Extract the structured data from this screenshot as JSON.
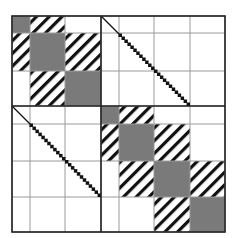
{
  "diagram": {
    "colors": {
      "background": "#ffffff",
      "grid_line": "#9a9a9a",
      "border": "#222222",
      "dense_block": "#7a7a7a",
      "hatch": "#111111",
      "diagonal": "#111111"
    },
    "columns": [
      12,
      30,
      65,
      101,
      119,
      154,
      190,
      225
    ],
    "rows": [
      16,
      33,
      71,
      106,
      124,
      161,
      197,
      232
    ],
    "mid_x": 101,
    "mid_y": 106,
    "blocks": [
      {
        "r": 0,
        "c": 0,
        "type": "dense"
      },
      {
        "r": 0,
        "c": 1,
        "type": "hatch"
      },
      {
        "r": 1,
        "c": 0,
        "type": "hatch"
      },
      {
        "r": 1,
        "c": 1,
        "type": "dense"
      },
      {
        "r": 1,
        "c": 2,
        "type": "hatch"
      },
      {
        "r": 2,
        "c": 1,
        "type": "hatch"
      },
      {
        "r": 2,
        "c": 2,
        "type": "dense"
      },
      {
        "r": 3,
        "c": 3,
        "type": "dense"
      },
      {
        "r": 3,
        "c": 4,
        "type": "hatch"
      },
      {
        "r": 4,
        "c": 3,
        "type": "hatch"
      },
      {
        "r": 4,
        "c": 4,
        "type": "dense"
      },
      {
        "r": 4,
        "c": 5,
        "type": "hatch"
      },
      {
        "r": 5,
        "c": 4,
        "type": "hatch"
      },
      {
        "r": 5,
        "c": 5,
        "type": "dense"
      },
      {
        "r": 5,
        "c": 6,
        "type": "hatch"
      },
      {
        "r": 6,
        "c": 5,
        "type": "hatch"
      },
      {
        "r": 6,
        "c": 6,
        "type": "dense"
      }
    ],
    "diagonals": [
      {
        "name": "top-right-coupling",
        "x1": 101,
        "y1": 16,
        "x2": 190,
        "y2": 106
      },
      {
        "name": "bottom-left-coupling",
        "x1": 12,
        "y1": 106,
        "x2": 101,
        "y2": 197
      }
    ]
  }
}
